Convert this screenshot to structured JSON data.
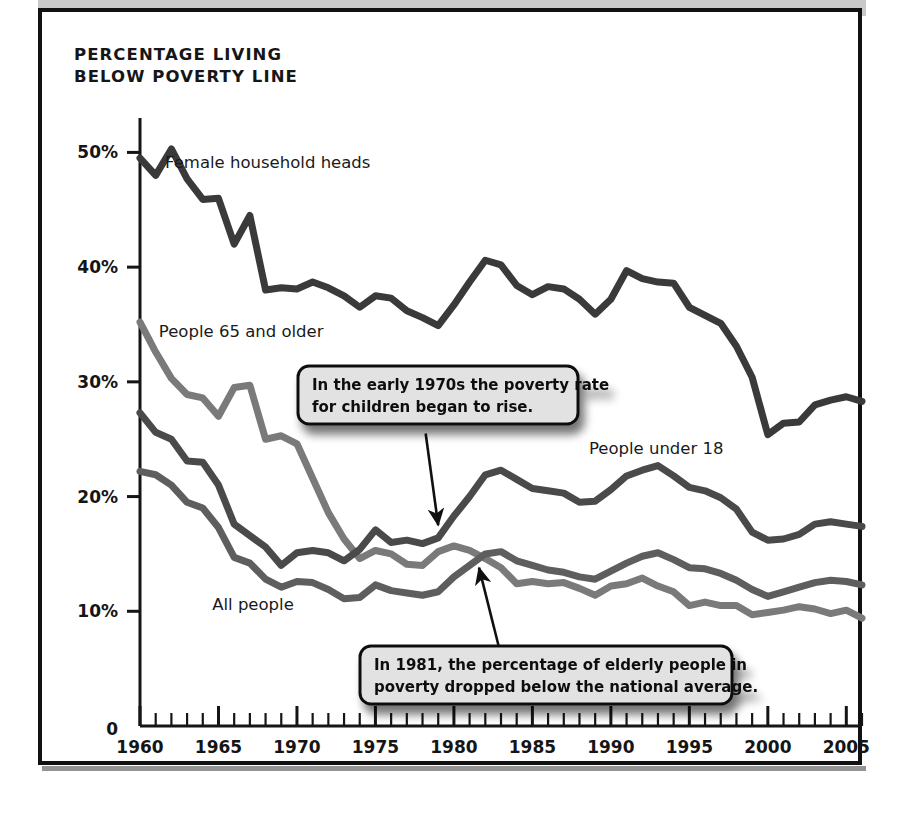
{
  "figure": {
    "title": "PERCENTAGE LIVING\nBELOW POVERTY LINE",
    "frame_color": "#111111",
    "topbar_color": "#c9c9c9",
    "background": "#ffffff"
  },
  "chart_data": {
    "type": "line",
    "title": "PERCENTAGE LIVING BELOW POVERTY LINE",
    "xlabel": "",
    "ylabel": "",
    "xlim": [
      1960,
      2006
    ],
    "ylim": [
      0,
      53
    ],
    "grid": false,
    "legend": "inline-labels",
    "x_ticks": [
      1960,
      1965,
      1970,
      1975,
      1980,
      1985,
      1990,
      1995,
      2000,
      2005
    ],
    "x_tick_labels": [
      "1960",
      "1965",
      "1970",
      "1975",
      "1980",
      "1985",
      "1990",
      "1995",
      "2000",
      "2005"
    ],
    "x_minor_tick_step": 1,
    "y_ticks": [
      0,
      10,
      20,
      30,
      40,
      50
    ],
    "y_tick_labels": [
      "0",
      "10%",
      "20%",
      "30%",
      "40%",
      "50%"
    ],
    "x": [
      1960,
      1961,
      1962,
      1963,
      1964,
      1965,
      1966,
      1967,
      1968,
      1969,
      1970,
      1971,
      1972,
      1973,
      1974,
      1975,
      1976,
      1977,
      1978,
      1979,
      1980,
      1981,
      1982,
      1983,
      1984,
      1985,
      1986,
      1987,
      1988,
      1989,
      1990,
      1991,
      1992,
      1993,
      1994,
      1995,
      1996,
      1997,
      1998,
      1999,
      2000,
      2001,
      2002,
      2003,
      2004,
      2005,
      2006
    ],
    "series": [
      {
        "name": "Female household heads",
        "color": "#3a3a3a",
        "width": 7,
        "values": [
          49.5,
          48.0,
          50.3,
          47.7,
          45.9,
          46.0,
          42.0,
          44.5,
          38.0,
          38.2,
          38.1,
          38.7,
          38.2,
          37.5,
          36.5,
          37.5,
          37.3,
          36.2,
          35.6,
          34.9,
          36.7,
          38.7,
          40.6,
          40.2,
          38.4,
          37.6,
          38.3,
          38.1,
          37.2,
          35.9,
          37.2,
          39.7,
          39.0,
          38.7,
          38.6,
          36.5,
          35.8,
          35.1,
          33.1,
          30.4,
          25.4,
          26.4,
          26.5,
          28.0,
          28.4,
          28.7,
          28.3
        ]
      },
      {
        "name": "People under 18",
        "color": "#4a4a4a",
        "width": 7,
        "values": [
          27.3,
          25.6,
          25.0,
          23.1,
          23.0,
          21.0,
          17.6,
          16.6,
          15.6,
          14.0,
          15.1,
          15.3,
          15.1,
          14.4,
          15.4,
          17.1,
          16.0,
          16.2,
          15.9,
          16.4,
          18.3,
          20.0,
          21.9,
          22.3,
          21.5,
          20.7,
          20.5,
          20.3,
          19.5,
          19.6,
          20.6,
          21.8,
          22.3,
          22.7,
          21.8,
          20.8,
          20.5,
          19.9,
          18.9,
          16.9,
          16.2,
          16.3,
          16.7,
          17.6,
          17.8,
          17.6,
          17.4
        ]
      },
      {
        "name": "All people",
        "color": "#5e5e5e",
        "width": 7,
        "values": [
          22.2,
          21.9,
          21.0,
          19.5,
          19.0,
          17.3,
          14.7,
          14.2,
          12.8,
          12.1,
          12.6,
          12.5,
          11.9,
          11.1,
          11.2,
          12.3,
          11.8,
          11.6,
          11.4,
          11.7,
          13.0,
          14.0,
          15.0,
          15.2,
          14.4,
          14.0,
          13.6,
          13.4,
          13.0,
          12.8,
          13.5,
          14.2,
          14.8,
          15.1,
          14.5,
          13.8,
          13.7,
          13.3,
          12.7,
          11.9,
          11.3,
          11.7,
          12.1,
          12.5,
          12.7,
          12.6,
          12.3
        ]
      },
      {
        "name": "People 65 and older",
        "color": "#7a7a7a",
        "width": 7,
        "values": [
          35.2,
          32.6,
          30.3,
          28.9,
          28.6,
          27.0,
          29.5,
          29.7,
          25.0,
          25.3,
          24.6,
          21.6,
          18.6,
          16.3,
          14.6,
          15.3,
          15.0,
          14.1,
          14.0,
          15.2,
          15.7,
          15.3,
          14.6,
          13.8,
          12.4,
          12.6,
          12.4,
          12.5,
          12.0,
          11.4,
          12.2,
          12.4,
          12.9,
          12.2,
          11.7,
          10.5,
          10.8,
          10.5,
          10.5,
          9.7,
          9.9,
          10.1,
          10.4,
          10.2,
          9.8,
          10.1,
          9.4
        ]
      }
    ],
    "series_labels": [
      {
        "name": "Female household heads",
        "x": 1961.6,
        "y": 48.6
      },
      {
        "name": "People 65 and older",
        "x": 1961.2,
        "y": 33.9
      },
      {
        "name": "People under 18",
        "x": 1988.6,
        "y": 23.7
      },
      {
        "name": "All people",
        "x": 1964.6,
        "y": 10.1
      }
    ],
    "annotations": [
      {
        "id": "children-rise",
        "text": "In the early 1970s the poverty rate\nfor children began to rise.",
        "arrow_from": {
          "x": 1978.2,
          "y": 25.5
        },
        "arrow_to": {
          "x": 1979.0,
          "y": 17.5
        }
      },
      {
        "id": "elderly-below-average",
        "text": "In 1981, the percentage of elderly people in\npoverty dropped below the national average.",
        "arrow_from": {
          "x": 1983.1,
          "y": 5.6
        },
        "arrow_to": {
          "x": 1981.6,
          "y": 13.8
        }
      }
    ]
  }
}
